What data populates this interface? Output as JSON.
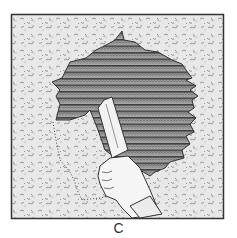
{
  "figure": {
    "caption": "C",
    "colors": {
      "frame": "#333333",
      "wall": "#e6e6e6",
      "texture": "#8a8a8a",
      "lath_dark": "#4a4a4a",
      "lath_light": "#9a9a9a",
      "trowel": "#f0f0f0",
      "handle": "#2e2e2e",
      "hand": "#f4f4f4"
    }
  }
}
